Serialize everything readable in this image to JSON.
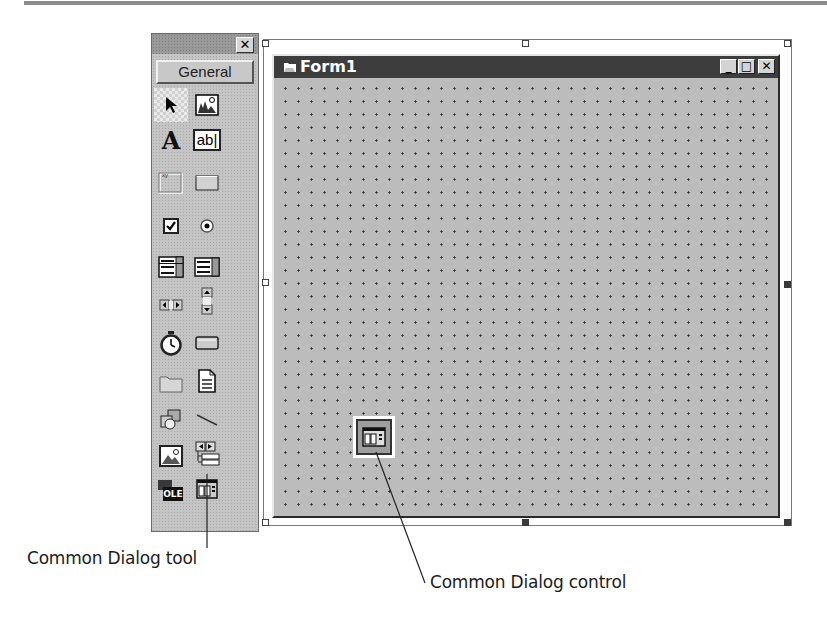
{
  "toolbox": {
    "close_label": "✕",
    "tab_label": "General",
    "tools": [
      {
        "name": "pointer",
        "row": 0,
        "col": 0,
        "selected": true
      },
      {
        "name": "picturebox",
        "row": 0,
        "col": 1
      },
      {
        "name": "label",
        "row": 1,
        "col": 0,
        "glyph": "A"
      },
      {
        "name": "textbox",
        "row": 1,
        "col": 1,
        "glyph": "ab|"
      },
      {
        "name": "frame",
        "row": 2,
        "col": 0,
        "glyph": "xy"
      },
      {
        "name": "commandbutton",
        "row": 2,
        "col": 1
      },
      {
        "name": "checkbox",
        "row": 3,
        "col": 0
      },
      {
        "name": "optionbutton",
        "row": 3,
        "col": 1
      },
      {
        "name": "combobox",
        "row": 4,
        "col": 0
      },
      {
        "name": "listbox",
        "row": 4,
        "col": 1
      },
      {
        "name": "hscrollbar",
        "row": 5,
        "col": 0
      },
      {
        "name": "vscrollbar",
        "row": 5,
        "col": 1
      },
      {
        "name": "timer",
        "row": 6,
        "col": 0
      },
      {
        "name": "drivelistbox",
        "row": 6,
        "col": 1
      },
      {
        "name": "dirlistbox",
        "row": 7,
        "col": 0
      },
      {
        "name": "filelistbox",
        "row": 7,
        "col": 1
      },
      {
        "name": "shape",
        "row": 8,
        "col": 0
      },
      {
        "name": "line",
        "row": 8,
        "col": 1
      },
      {
        "name": "image",
        "row": 9,
        "col": 0
      },
      {
        "name": "data",
        "row": 9,
        "col": 1
      },
      {
        "name": "ole",
        "row": 10,
        "col": 0,
        "glyph": "OLE"
      },
      {
        "name": "commondialog",
        "row": 10,
        "col": 1
      }
    ]
  },
  "form": {
    "title": "Form1",
    "minimize_label": "_",
    "maximize_label": "□",
    "close_label": "✕"
  },
  "callouts": {
    "tool_label": "Common Dialog tool",
    "control_label": "Common Dialog control"
  }
}
